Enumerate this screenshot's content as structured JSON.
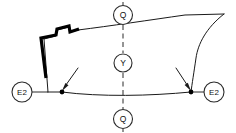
{
  "figure": {
    "background_color": "#ffffff",
    "line_color": "#1a1a1a",
    "bold_line_color": "#000000",
    "width": 236,
    "height": 133
  },
  "balloons": {
    "section_top": {
      "label": "Q",
      "cx": 123,
      "cy": 15,
      "r": 9.5
    },
    "section_bottom": {
      "label": "Q",
      "cx": 123,
      "cy": 119,
      "r": 9.5
    },
    "center_axis": {
      "label": "Y",
      "cx": 123,
      "cy": 63,
      "r": 9
    },
    "datum_left": {
      "label": "E2",
      "cx": 22,
      "cy": 92,
      "r": 10
    },
    "datum_right": {
      "label": "E2",
      "cx": 214,
      "cy": 92,
      "r": 10
    }
  },
  "annotations": {
    "leader_left": {
      "name": "left-vertex-leader",
      "from_x": 78,
      "from_y": 68,
      "to_x": 62,
      "to_y": 90
    },
    "leader_right": {
      "name": "right-vertex-leader",
      "from_x": 176,
      "from_y": 68,
      "to_x": 190,
      "to_y": 90
    },
    "vertex_left": {
      "cx": 62,
      "cy": 92,
      "r": 2.3
    },
    "vertex_right": {
      "cx": 191,
      "cy": 92,
      "r": 2.3
    }
  },
  "geometry": {
    "top_edge_curve": "M 44,39 L 56,36 L 57,30 L 69,27 L 70,32 L 78,30 C 110,26 150,20 185,15 L 224,14",
    "bottom_edge_curve": "M 48,92 L 62,92 C 100,97 150,96 191,92",
    "left_vertical_edge": "M 44,39 L 48,92",
    "right_side_curve": "M 224,14 C 206,28 198,44 196,58 C 194,72 192,84 191,92",
    "bold_segment": "M 46,78 L 41,38 L 56,35 L 57,29 L 69,26 L 70,32 L 79,29",
    "centerline_segments": [
      "M 123,2 L 123,5",
      "M 123,25 L 123,53",
      "M 123,73 L 123,109",
      "M 123,129 L 123,132"
    ],
    "datum_leader_left": "M 32,92 L 48,92",
    "datum_leader_right": "M 191,92 L 204,92"
  }
}
